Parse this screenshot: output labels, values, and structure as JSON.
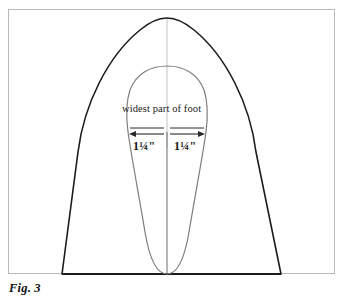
{
  "figure": {
    "caption": "Fig. 3"
  },
  "diagram": {
    "outer_shape_name": "slipper-sole-pattern-outline",
    "inner_shape_name": "foot-outline",
    "center_line_name": "center-fold-line",
    "outer_stroke_color": "#1c1c1c",
    "inner_stroke_color": "#7d7d7d",
    "center_line_color": "#8a8a8a",
    "frame_color": "#b9b9bb",
    "background_color": "#ffffff"
  },
  "annotations": {
    "widest_label": "widest part of foot",
    "measure_left": "1¼\"",
    "measure_right": "1¼\"",
    "arrow_left_direction": "left",
    "arrow_right_direction": "right"
  }
}
